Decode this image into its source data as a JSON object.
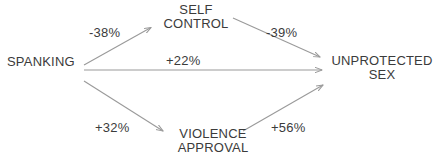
{
  "diagram": {
    "type": "path-diagram",
    "background_color": "#ffffff",
    "line_color": "#9a9a9a",
    "text_color": "#3b3b3b",
    "nodes": [
      {
        "id": "spanking",
        "label": "SPANKING",
        "lines": [
          "SPANKING"
        ]
      },
      {
        "id": "self_control",
        "label": "SELF CONTROL",
        "line1": "SELF",
        "line2": "CONTROL"
      },
      {
        "id": "violence_approval",
        "label": "VIOLENCE APPROVAL",
        "line1": "VIOLENCE",
        "line2": "APPROVAL"
      },
      {
        "id": "unprotected_sex",
        "label": "UNPROTECTED SEX",
        "line1": "UNPROTECTED",
        "line2": "SEX"
      }
    ],
    "edges": [
      {
        "id": "spanking_to_self_control",
        "from": "SPANKING",
        "to": "SELF CONTROL",
        "label": "-38%",
        "sign": "negative"
      },
      {
        "id": "self_control_to_unprotected_sex",
        "from": "SELF CONTROL",
        "to": "UNPROTECTED SEX",
        "label": "-39%",
        "sign": "negative"
      },
      {
        "id": "spanking_to_unprotected_sex",
        "from": "SPANKING",
        "to": "UNPROTECTED SEX",
        "label": "+22%",
        "sign": "positive"
      },
      {
        "id": "spanking_to_violence_approval",
        "from": "SPANKING",
        "to": "VIOLENCE APPROVAL",
        "label": "+32%",
        "sign": "positive"
      },
      {
        "id": "violence_approval_to_unprotected_sex",
        "from": "VIOLENCE APPROVAL",
        "to": "UNPROTECTED SEX",
        "label": "+56%",
        "sign": "positive"
      }
    ]
  }
}
